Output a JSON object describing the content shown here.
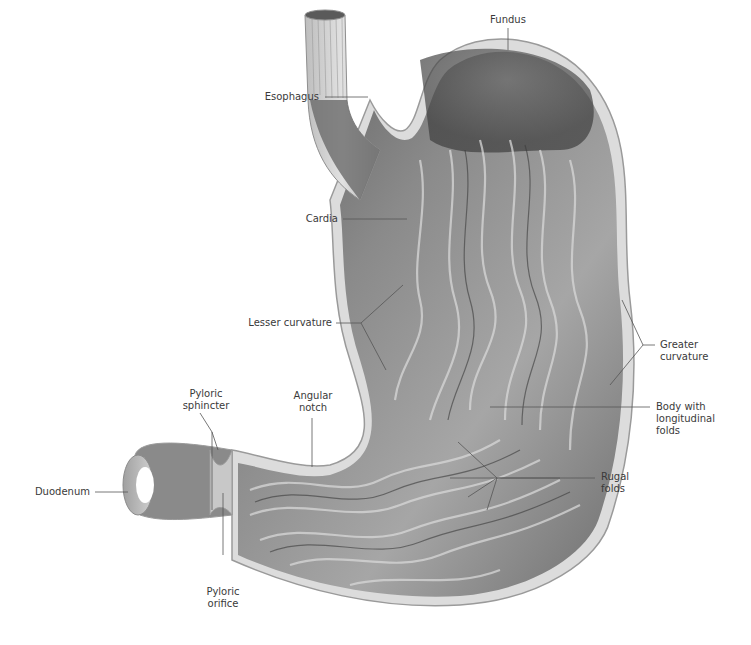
{
  "figure": {
    "colors": {
      "background": "#ffffff",
      "label_text": "#3a3a3a",
      "leader_line": "#555555",
      "mucosa_dark": "#4a4a4a",
      "mucosa_mid": "#8c8c8c",
      "mucosa_light": "#c8c8c8",
      "wall": "#d9d9d9"
    }
  },
  "labels": {
    "esophagus": {
      "lines": [
        "Esophagus"
      ]
    },
    "fundus": {
      "lines": [
        "Fundus"
      ]
    },
    "cardia": {
      "lines": [
        "Cardia"
      ]
    },
    "lesser_curvature": {
      "lines": [
        "Lesser curvature"
      ]
    },
    "greater_curvature": {
      "lines": [
        "Greater",
        "curvature"
      ]
    },
    "pyloric_sphincter": {
      "lines": [
        "Pyloric",
        "sphincter"
      ]
    },
    "angular_notch": {
      "lines": [
        "Angular",
        "notch"
      ]
    },
    "body_with_longitudinal_folds": {
      "lines": [
        "Body with",
        "longitudinal",
        "folds"
      ]
    },
    "rugal_folds": {
      "lines": [
        "Rugal",
        "folds"
      ]
    },
    "duodenum": {
      "lines": [
        "Duodenum"
      ]
    },
    "pyloric_orifice": {
      "lines": [
        "Pyloric",
        "orifice"
      ]
    }
  }
}
